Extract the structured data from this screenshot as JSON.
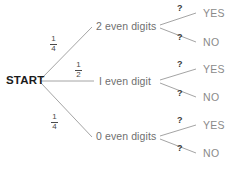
{
  "diagram": {
    "type": "probability-tree",
    "root": {
      "label": "START"
    },
    "branches": [
      {
        "label": "2 even digits",
        "probability": "1/4",
        "probability_numerator": "1",
        "probability_denominator": "4",
        "leaves": [
          {
            "label": "YES",
            "probability": "?"
          },
          {
            "label": "NO",
            "probability": "?"
          }
        ]
      },
      {
        "label": "I even digit",
        "probability": "1/2",
        "probability_numerator": "1",
        "probability_denominator": "2",
        "leaves": [
          {
            "label": "YES",
            "probability": "?"
          },
          {
            "label": "NO",
            "probability": "?"
          }
        ]
      },
      {
        "label": "0 even digits",
        "probability": "1/4",
        "probability_numerator": "1",
        "probability_denominator": "4",
        "leaves": [
          {
            "label": "YES",
            "probability": "?"
          },
          {
            "label": "NO",
            "probability": "?"
          }
        ]
      }
    ]
  },
  "colors": {
    "line": "#9a9a9a",
    "start_text": "#1b1b1b",
    "stage_text": "#6f6f6f",
    "leaf_text": "#8a8a8a",
    "fraction_text": "#4a4a4a",
    "background": "#ffffff"
  }
}
